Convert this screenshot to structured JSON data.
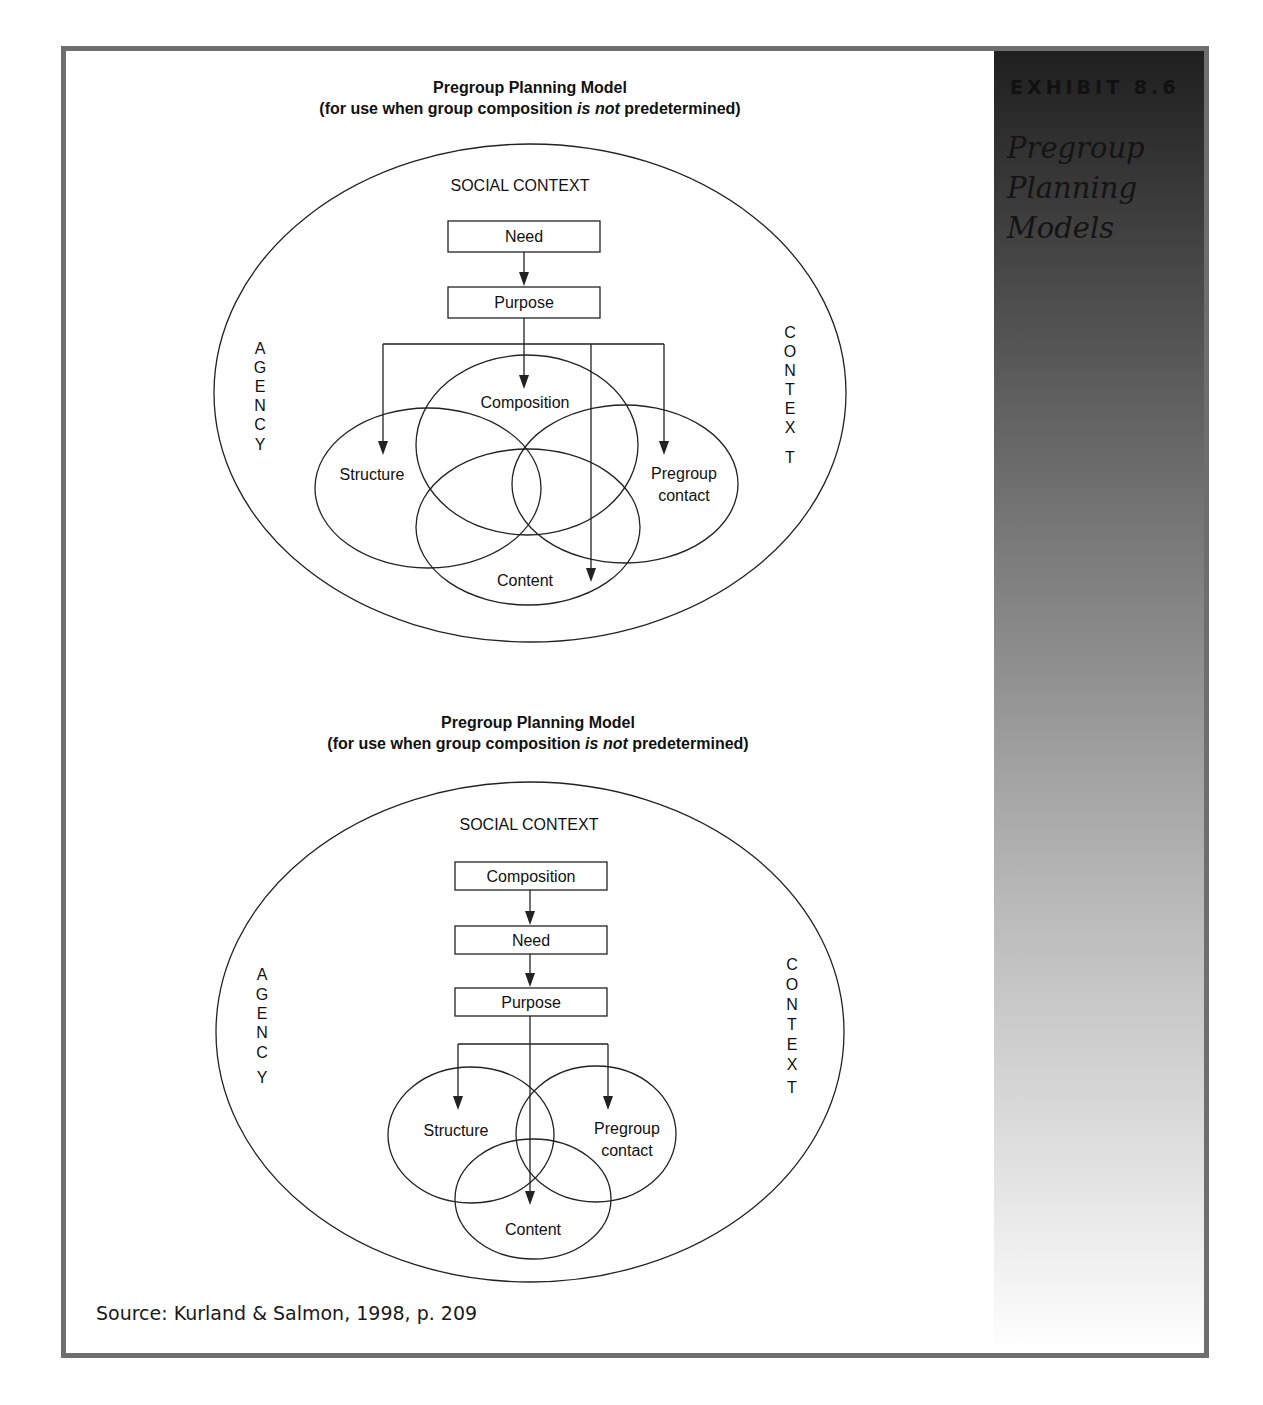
{
  "exhibit": {
    "label": "EXHIBIT 8.6",
    "title_lines": [
      "Pregroup",
      "Planning",
      "Models"
    ]
  },
  "diagrams": [
    {
      "title": "Pregroup Planning Model",
      "subtitle_pre": "(for use when group composition ",
      "subtitle_em": "is not",
      "subtitle_post": " predetermined)",
      "outer_label": "SOCIAL CONTEXT",
      "left_label": "AGENCY",
      "right_label": "CONTEXT",
      "flow_boxes": [
        "Need",
        "Purpose"
      ],
      "venn": [
        "Composition",
        "Structure",
        "Pregroup contact",
        "Content"
      ]
    },
    {
      "title": "Pregroup Planning Model",
      "subtitle_pre": "(for use when group composition ",
      "subtitle_em": "is not",
      "subtitle_post": " predetermined)",
      "outer_label": "SOCIAL CONTEXT",
      "left_label": "AGENCY",
      "right_label": "CONTEXT",
      "flow_boxes": [
        "Composition",
        "Need",
        "Purpose"
      ],
      "venn": [
        "Structure",
        "Pregroup contact",
        "Content"
      ]
    }
  ],
  "labels": {
    "pregroup_line1": "Pregroup",
    "pregroup_line2": "contact"
  },
  "agency_letters": [
    "A",
    "G",
    "E",
    "N",
    "C",
    "Y"
  ],
  "context_letters": [
    "C",
    "O",
    "N",
    "T",
    "E",
    "X",
    "T"
  ],
  "source": "Source: Kurland & Salmon, 1998, p. 209",
  "colors": {
    "frame": "#6e6e6e",
    "panel_top": "#1f1f1f",
    "panel_bottom": "#ffffff",
    "line": "#222222"
  }
}
